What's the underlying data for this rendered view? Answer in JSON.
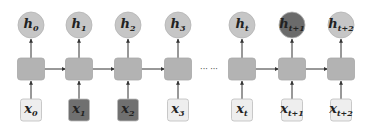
{
  "colors": {
    "cell_fill": "#b3b3b3",
    "cell_stroke": "#a8a8a8",
    "hidden_fill": "#c6c6c6",
    "hidden_stroke": "#b4b4b4",
    "hidden_highlight_fill": "#6b6b6b",
    "input_fill": "#eeeeee",
    "input_stroke": "#bdbdbd",
    "input_highlight_fill": "#707070",
    "arrow": "#333333",
    "text": "#222222"
  },
  "ellipsis": {
    "text": "··· ···",
    "x": 209,
    "y": 72
  },
  "steps": [
    {
      "cx": 31,
      "hidden": {
        "base": "h",
        "sub": "0",
        "highlight": false
      },
      "input": {
        "base": "x",
        "sub": "0",
        "highlight": false
      },
      "arrow_right": true
    },
    {
      "cx": 79,
      "hidden": {
        "base": "h",
        "sub": "1",
        "highlight": false
      },
      "input": {
        "base": "x",
        "sub": "1",
        "highlight": true
      },
      "arrow_right": true
    },
    {
      "cx": 128,
      "hidden": {
        "base": "h",
        "sub": "2",
        "highlight": false
      },
      "input": {
        "base": "x",
        "sub": "2",
        "highlight": true
      },
      "arrow_right": true
    },
    {
      "cx": 178,
      "hidden": {
        "base": "h",
        "sub": "3",
        "highlight": false
      },
      "input": {
        "base": "x",
        "sub": "3",
        "highlight": false
      },
      "arrow_right": false
    },
    {
      "cx": 242,
      "hidden": {
        "base": "h",
        "sub": "t",
        "highlight": false
      },
      "input": {
        "base": "x",
        "sub": "t",
        "highlight": false
      },
      "arrow_right": true
    },
    {
      "cx": 292,
      "hidden": {
        "base": "h",
        "sub": "t+1",
        "highlight": true
      },
      "input": {
        "base": "x",
        "sub": "t+1",
        "highlight": false
      },
      "arrow_right": true
    },
    {
      "cx": 341,
      "hidden": {
        "base": "h",
        "sub": "t+2",
        "highlight": false
      },
      "input": {
        "base": "x",
        "sub": "t+2",
        "highlight": false
      },
      "arrow_right": false
    }
  ],
  "geometry": {
    "hidden_cy": 25,
    "hidden_r": 13,
    "cell_y": 58,
    "cell_h": 22,
    "cell_w": 27,
    "input_y": 99,
    "input_h": 22,
    "input_w": 21
  }
}
